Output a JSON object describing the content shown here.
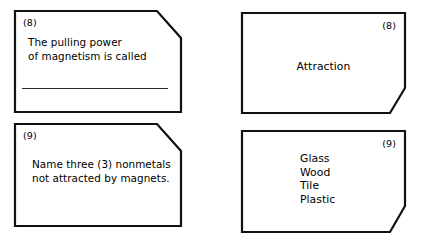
{
  "page": {
    "background_color": "#ffffff",
    "ink_color": "#111111",
    "layout": "2x2 flashcard grid: left column questions, right column answers"
  },
  "cards": [
    {
      "role": "question",
      "number_label": "(8)",
      "number_position": "top-left",
      "cut_corner": "top-right",
      "text": "The pulling power\nof magnetism is called",
      "has_answer_line": true
    },
    {
      "role": "answer",
      "number_label": "(8)",
      "number_position": "top-right",
      "cut_corner": "bottom-right",
      "text": "Attraction",
      "has_answer_line": false
    },
    {
      "role": "question",
      "number_label": "(9)",
      "number_position": "top-left",
      "cut_corner": "top-right",
      "text": "Name three (3) nonmetals\nnot attracted by magnets.",
      "has_answer_line": false
    },
    {
      "role": "answer",
      "number_label": "(9)",
      "number_position": "top-right",
      "cut_corner": "bottom-right",
      "text": "Glass\nWood\nTile\nPlastic",
      "has_answer_line": false
    }
  ]
}
